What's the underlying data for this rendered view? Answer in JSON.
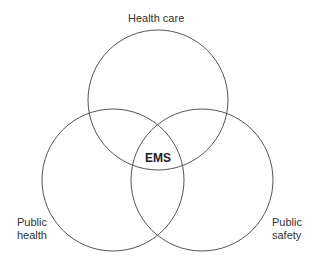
{
  "diagram": {
    "type": "venn",
    "sets": [
      {
        "label": "Health care"
      },
      {
        "label_line1": "Public",
        "label_line2": "health"
      },
      {
        "label_line1": "Public",
        "label_line2": "safety"
      }
    ],
    "intersection": "EMS",
    "stroke_color": "#555555"
  }
}
